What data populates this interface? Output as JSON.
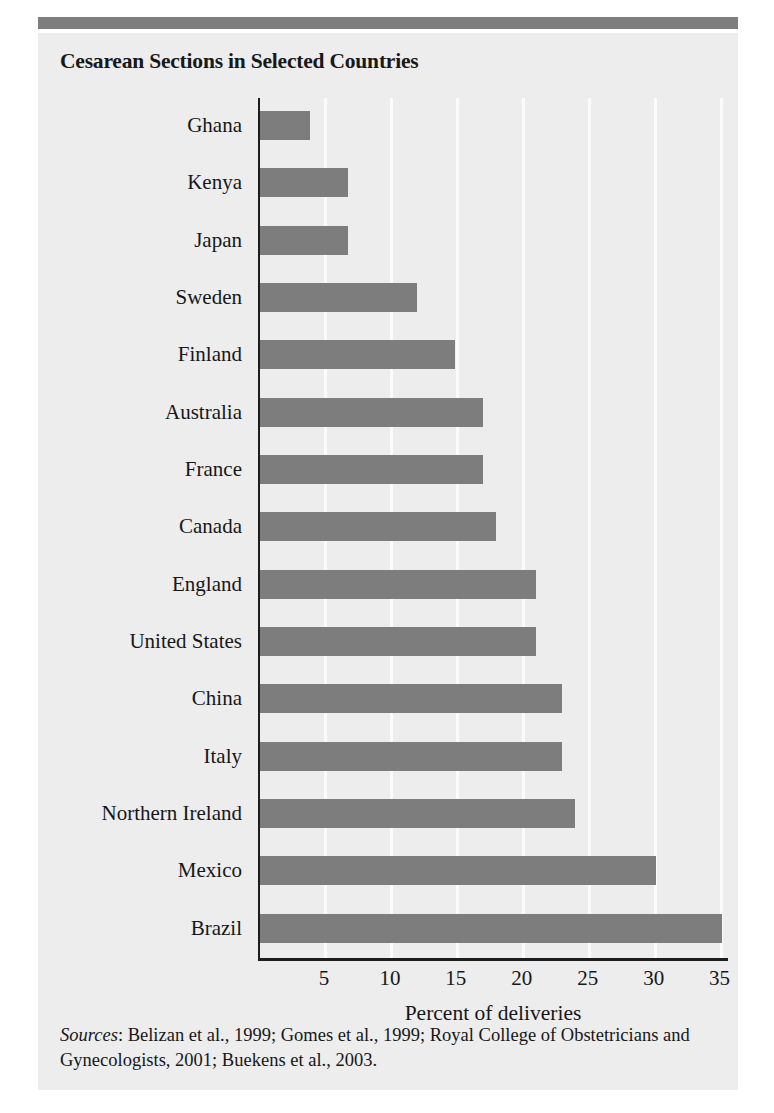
{
  "figure": {
    "title": "Cesarean Sections in Selected Countries",
    "sources_keyword": "Sources",
    "sources_text": ": Belizan et al., 1999; Gomes et al., 1999; Royal College of Obstetricians and Gynecologists, 2001; Buekens et al., 2003."
  },
  "colors": {
    "bar": "#7d7d7d",
    "panel_background": "#ededed",
    "page_background": "#ffffff",
    "axis": "#1d1d1f",
    "gridline": "#fbfbfb",
    "top_rule": "#7e7e7e",
    "text": "#161718"
  },
  "chart_data": {
    "type": "bar",
    "orientation": "horizontal",
    "title": "Cesarean Sections in Selected Countries",
    "xlabel": "Percent of deliveries",
    "ylabel": "",
    "xlim": [
      0,
      36.7
    ],
    "xticks": [
      5,
      10,
      15,
      20,
      25,
      30,
      35
    ],
    "xtick_labels": [
      "5",
      "10",
      "15",
      "20",
      "25",
      "30",
      "35"
    ],
    "grid": "vertical",
    "legend": "none",
    "categories": [
      "Ghana",
      "Kenya",
      "Japan",
      "Sweden",
      "Finland",
      "Australia",
      "France",
      "Canada",
      "England",
      "United States",
      "China",
      "Italy",
      "Northern Ireland",
      "Mexico",
      "Brazil"
    ],
    "values": [
      3.8,
      6.7,
      6.7,
      11.9,
      14.8,
      16.9,
      16.9,
      17.9,
      20.9,
      20.9,
      22.9,
      22.9,
      23.9,
      30.0,
      35.0
    ]
  }
}
